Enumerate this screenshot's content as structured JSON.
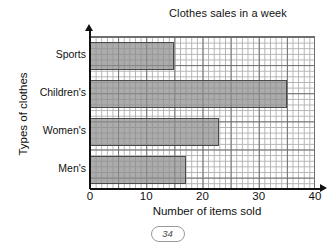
{
  "chart_data": {
    "type": "bar",
    "orientation": "horizontal",
    "title": "Clothes sales in a week",
    "xlabel": "Number of items sold",
    "ylabel": "Types of clothes",
    "categories": [
      "Sports",
      "Children's",
      "Women's",
      "Men's"
    ],
    "values": [
      15,
      35,
      23,
      17
    ],
    "xlim": [
      0,
      40
    ],
    "xticks": [
      "0",
      "10",
      "20",
      "30",
      "40"
    ],
    "xtick_values": [
      0,
      10,
      20,
      30,
      40
    ],
    "grid": true,
    "grid_minor_step": 1,
    "grid_major_step": 5,
    "legend": "none",
    "bar_color": "#8c8c8c",
    "bar_edge_color": "#4a4a4a",
    "grid_color": "#b2b2b2",
    "grid_major_color": "#6e6e6e",
    "axis_color": "#111111"
  },
  "footer": {
    "page_number": "34"
  }
}
